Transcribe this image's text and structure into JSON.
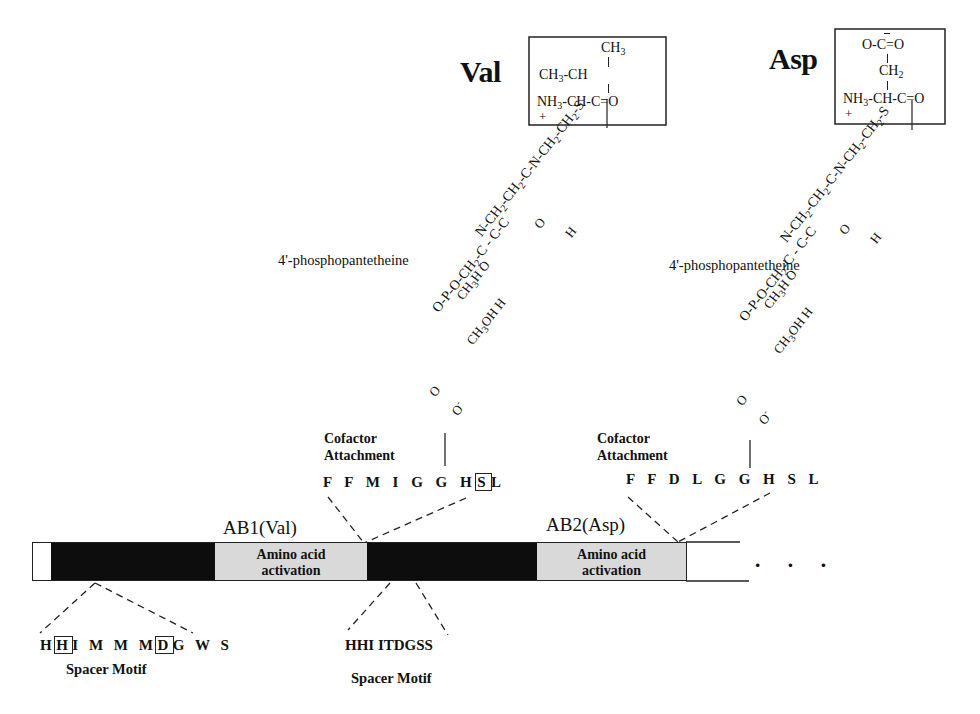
{
  "diagram": {
    "amino_acids": [
      {
        "name": "Val",
        "structure_lines": [
          "CH3",
          "CH3-CH",
          "NH3-CH-C=O"
        ],
        "charge": "+",
        "thioester": "S"
      },
      {
        "name": "Asp",
        "structure_lines": [
          "O-C=O",
          "CH2",
          "NH3-CH-C=O"
        ],
        "charge": "+",
        "thioester": "S"
      }
    ],
    "cofactor": {
      "label": "4'-phosphopantetheine",
      "chain_upper": "N-CH2-CH2-C-N-CH2-CH2-S",
      "chain_upper_subs": [
        "O",
        "H"
      ],
      "chain_middle": "O-P-O-CH2-C - C-C",
      "chain_middle_subs": [
        "CH3",
        "H",
        "O",
        "CH3",
        "OH",
        "H"
      ],
      "phosphate_O": "O"
    },
    "cofactor_sites": [
      {
        "title_line1": "Cofactor",
        "title_line2": "Attachment",
        "sequence_prefix": "F F M I G G H",
        "sequence_boxed": "S",
        "sequence_suffix": "L"
      },
      {
        "title_line1": "Cofactor",
        "title_line2": "Attachment",
        "sequence_prefix": "F F D L G G H S L",
        "sequence_boxed": "",
        "sequence_suffix": ""
      }
    ],
    "domains": [
      {
        "label": "AB1(Val)"
      },
      {
        "label": "AB2(Asp)"
      }
    ],
    "bar": {
      "segments": [
        {
          "type": "white",
          "label": ""
        },
        {
          "type": "black",
          "label": ""
        },
        {
          "type": "grey",
          "label_line1": "Amino acid",
          "label_line2": "activation"
        },
        {
          "type": "black",
          "label": ""
        },
        {
          "type": "grey",
          "label_line1": "Amino acid",
          "label_line2": "activation"
        },
        {
          "type": "white",
          "label": ""
        }
      ],
      "continuation": "· · ·",
      "colors": {
        "black": "#0d0d0d",
        "grey": "#d9d9d9",
        "white": "#ffffff"
      }
    },
    "spacer_motifs": [
      {
        "seq_parts": [
          "H",
          "H",
          "I M M M",
          "D",
          "G W S"
        ],
        "boxed": [
          false,
          true,
          false,
          true,
          false
        ],
        "label": "Spacer Motif"
      },
      {
        "sequence": "HHI ITDGSS",
        "label": "Spacer Motif"
      }
    ]
  }
}
